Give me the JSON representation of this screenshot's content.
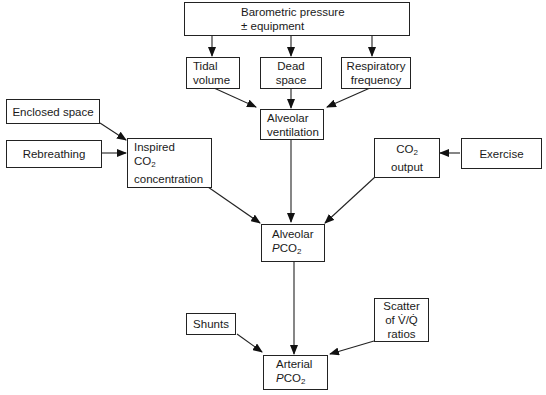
{
  "diagram": {
    "nodes": {
      "barometric": {
        "line1": "Barometric pressure",
        "line2": "± equipment"
      },
      "tidal": {
        "line1": "Tidal",
        "line2": "volume"
      },
      "dead": {
        "line1": "Dead",
        "line2": "space"
      },
      "resp": {
        "line1": "Respiratory",
        "line2": "frequency"
      },
      "enclosed": {
        "line1": "Enclosed space"
      },
      "rebreathing": {
        "line1": "Rebreathing"
      },
      "inspired": {
        "line1": "Inspired",
        "line2a": "CO",
        "line2sub": "2",
        "line3": "concentration"
      },
      "alv_vent": {
        "line1": "Alveolar",
        "line2": "ventilation"
      },
      "co2out": {
        "line1a": "CO",
        "line1sub": "2",
        "line2": "output"
      },
      "exercise": {
        "line1": "Exercise"
      },
      "alv_pco2": {
        "line1": "Alveolar",
        "line2p": "P",
        "line2a": "CO",
        "line2sub": "2"
      },
      "shunts": {
        "line1": "Shunts"
      },
      "scatter": {
        "line1": "Scatter",
        "line2": "of V̇/Q̇",
        "line3": "ratios"
      },
      "art_pco2": {
        "line1": "Arterial",
        "line2p": "P",
        "line2a": "CO",
        "line2sub": "2"
      }
    },
    "edges": [
      [
        "barometric",
        "tidal"
      ],
      [
        "barometric",
        "dead"
      ],
      [
        "barometric",
        "resp"
      ],
      [
        "tidal",
        "alv_vent"
      ],
      [
        "dead",
        "alv_vent"
      ],
      [
        "resp",
        "alv_vent"
      ],
      [
        "enclosed",
        "inspired"
      ],
      [
        "rebreathing",
        "inspired"
      ],
      [
        "exercise",
        "co2out"
      ],
      [
        "inspired",
        "alv_pco2"
      ],
      [
        "alv_vent",
        "alv_pco2"
      ],
      [
        "co2out",
        "alv_pco2"
      ],
      [
        "alv_pco2",
        "art_pco2"
      ],
      [
        "shunts",
        "art_pco2"
      ],
      [
        "scatter",
        "art_pco2"
      ]
    ]
  }
}
